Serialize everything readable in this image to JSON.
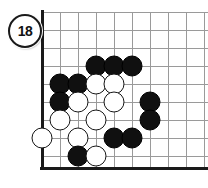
{
  "diagram": {
    "type": "go-board-diagram",
    "move_number_label": "18",
    "board": {
      "corner": "top-left",
      "line_spacing_px": 18,
      "origin_x_px": 42,
      "origin_y_px": 12,
      "columns_visible": 10,
      "rows_visible": 9,
      "column_x_px": [
        42,
        60,
        78,
        96,
        114,
        132,
        150,
        168,
        186,
        204
      ],
      "row_y_px": [
        12,
        30,
        48,
        66,
        84,
        102,
        120,
        138,
        156
      ],
      "edges": {
        "left": true,
        "top": false,
        "bottom": true,
        "right": false
      },
      "star_points": [
        {
          "col": 3,
          "row": 6,
          "label": "4-4 point"
        }
      ],
      "grid_color": "#9a9a9a",
      "edge_color": "#1a1a1a",
      "background_color": "#ffffff"
    },
    "stones": [
      {
        "color": "black",
        "col": 3,
        "row": 3
      },
      {
        "color": "black",
        "col": 4,
        "row": 3
      },
      {
        "color": "black",
        "col": 5,
        "row": 3
      },
      {
        "color": "black",
        "col": 1,
        "row": 4
      },
      {
        "color": "black",
        "col": 2,
        "row": 4
      },
      {
        "color": "white",
        "col": 3,
        "row": 4
      },
      {
        "color": "white",
        "col": 4,
        "row": 4
      },
      {
        "color": "black",
        "col": 1,
        "row": 5
      },
      {
        "color": "white",
        "col": 2,
        "row": 5
      },
      {
        "color": "white",
        "col": 4,
        "row": 5
      },
      {
        "color": "black",
        "col": 6,
        "row": 5
      },
      {
        "color": "white",
        "col": 1,
        "row": 6
      },
      {
        "color": "white",
        "col": 3,
        "row": 6
      },
      {
        "color": "black",
        "col": 6,
        "row": 6
      },
      {
        "color": "white",
        "col": 0,
        "row": 7
      },
      {
        "color": "white",
        "col": 2,
        "row": 7
      },
      {
        "color": "black",
        "col": 4,
        "row": 7
      },
      {
        "color": "black",
        "col": 5,
        "row": 7
      },
      {
        "color": "black",
        "col": 2,
        "row": 8
      },
      {
        "color": "white",
        "col": 3,
        "row": 8
      }
    ],
    "stone_colors": {
      "black": "#101010",
      "white": "#ffffff",
      "outline": "#151515"
    }
  }
}
